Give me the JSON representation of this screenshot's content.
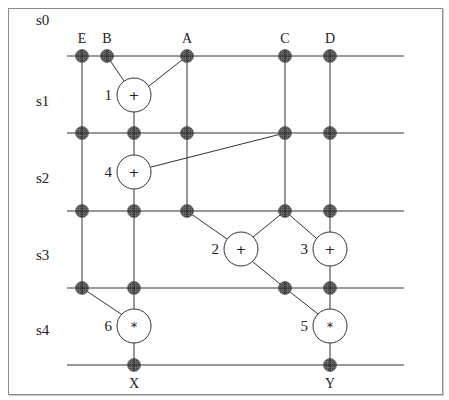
{
  "title": "",
  "steps": [
    {
      "label": "s0",
      "x": 36,
      "y": 20
    },
    {
      "label": "s1",
      "x": 36,
      "y": 101
    },
    {
      "label": "s2",
      "x": 36,
      "y": 178
    },
    {
      "label": "s3",
      "x": 36,
      "y": 255
    },
    {
      "label": "s4",
      "x": 36,
      "y": 330
    }
  ],
  "rails": [
    {
      "y": 56,
      "x1": 67,
      "x2": 404
    },
    {
      "y": 133,
      "x1": 67,
      "x2": 404
    },
    {
      "y": 211,
      "x1": 67,
      "x2": 404
    },
    {
      "y": 288,
      "x1": 67,
      "x2": 404
    },
    {
      "y": 365,
      "x1": 67,
      "x2": 404
    }
  ],
  "inputs": [
    {
      "label": "E",
      "x": 82,
      "y": 56
    },
    {
      "label": "B",
      "x": 107,
      "y": 56
    },
    {
      "label": "A",
      "x": 187,
      "y": 56
    },
    {
      "label": "C",
      "x": 285,
      "y": 56
    },
    {
      "label": "D",
      "x": 330,
      "y": 56
    }
  ],
  "outputs": [
    {
      "label": "X",
      "x": 134,
      "y": 365
    },
    {
      "label": "Y",
      "x": 330,
      "y": 365
    }
  ],
  "operations": [
    {
      "id": "1",
      "symbol": "+",
      "cx": 134,
      "cy": 95,
      "r": 17
    },
    {
      "id": "4",
      "symbol": "+",
      "cx": 134,
      "cy": 172,
      "r": 17
    },
    {
      "id": "2",
      "symbol": "+",
      "cx": 241,
      "cy": 249,
      "r": 17
    },
    {
      "id": "3",
      "symbol": "+",
      "cx": 330,
      "cy": 249,
      "r": 17
    },
    {
      "id": "6",
      "symbol": "*",
      "cx": 134,
      "cy": 326,
      "r": 17
    },
    {
      "id": "5",
      "symbol": "*",
      "cx": 330,
      "cy": 326,
      "r": 17
    }
  ],
  "register_nodes": [
    {
      "x": 82,
      "y": 56
    },
    {
      "x": 107,
      "y": 56
    },
    {
      "x": 187,
      "y": 56
    },
    {
      "x": 285,
      "y": 56
    },
    {
      "x": 330,
      "y": 56
    },
    {
      "x": 82,
      "y": 133
    },
    {
      "x": 134,
      "y": 133
    },
    {
      "x": 187,
      "y": 133
    },
    {
      "x": 285,
      "y": 133
    },
    {
      "x": 330,
      "y": 133
    },
    {
      "x": 82,
      "y": 211
    },
    {
      "x": 134,
      "y": 211
    },
    {
      "x": 187,
      "y": 211
    },
    {
      "x": 285,
      "y": 211
    },
    {
      "x": 330,
      "y": 211
    },
    {
      "x": 82,
      "y": 288
    },
    {
      "x": 134,
      "y": 288
    },
    {
      "x": 285,
      "y": 288
    },
    {
      "x": 330,
      "y": 288
    },
    {
      "x": 134,
      "y": 365
    },
    {
      "x": 330,
      "y": 365
    }
  ],
  "edges": [
    [
      107,
      56,
      124,
      81
    ],
    [
      187,
      56,
      149,
      86
    ],
    [
      134,
      112,
      134,
      133
    ],
    [
      82,
      56,
      82,
      288
    ],
    [
      187,
      56,
      187,
      211
    ],
    [
      285,
      56,
      285,
      211
    ],
    [
      330,
      56,
      330,
      232
    ],
    [
      134,
      133,
      134,
      155
    ],
    [
      151,
      167,
      285,
      133
    ],
    [
      134,
      189,
      134,
      309
    ],
    [
      187,
      211,
      227,
      239
    ],
    [
      285,
      211,
      253,
      237
    ],
    [
      285,
      211,
      316,
      238
    ],
    [
      253,
      262,
      285,
      288
    ],
    [
      330,
      266,
      330,
      309
    ],
    [
      285,
      288,
      318,
      314
    ],
    [
      82,
      288,
      121,
      314
    ],
    [
      134,
      343,
      134,
      365
    ],
    [
      330,
      343,
      330,
      365
    ]
  ],
  "colors": {
    "node_fill": "#5a5a5a",
    "line": "#333333",
    "border": "#8a8a8a"
  }
}
